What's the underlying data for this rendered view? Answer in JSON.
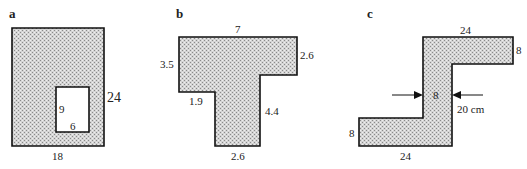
{
  "figure": {
    "fill_color": "#c8c8c8",
    "stroke_color": "#111111",
    "panels": [
      {
        "id": "a",
        "label": "a",
        "shape": "rectangle with rectangular hole",
        "dimensions": {
          "outer_height": "24",
          "outer_width": "18",
          "hole_height": "9",
          "hole_width": "6"
        }
      },
      {
        "id": "b",
        "label": "b",
        "shape": "T-shape",
        "dimensions": {
          "top": "7",
          "right": "2.6",
          "left": "3.5",
          "step": "1.9",
          "stem_right": "4.4",
          "bottom": "2.6"
        }
      },
      {
        "id": "c",
        "label": "c",
        "shape": "Z-shape",
        "dimensions": {
          "top": "24",
          "top_right": "8",
          "middle_width": "8",
          "middle_height": "20 cm",
          "bottom_left": "8",
          "bottom": "24"
        }
      }
    ]
  }
}
